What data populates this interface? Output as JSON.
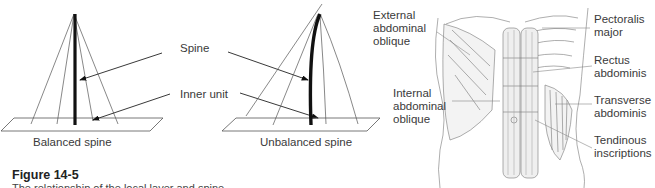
{
  "figure": {
    "number": "Figure 14-5",
    "caption": "The relationship of the local layer and spine."
  },
  "spine_diagram": {
    "callouts": {
      "spine": "Spine",
      "inner_unit": "Inner unit"
    },
    "balanced_label": "Balanced spine",
    "unbalanced_label": "Unbalanced spine"
  },
  "anatomy": {
    "labels": {
      "external_oblique": "External\nabdominal\noblique",
      "internal_oblique": "Internal\nabdominal\noblique",
      "pectoralis": "Pectoralis\nmajor",
      "rectus": "Rectus\nabdominis",
      "transverse": "Transverse\nabdominis",
      "tendinous": "Tendinous\ninscriptions"
    }
  }
}
